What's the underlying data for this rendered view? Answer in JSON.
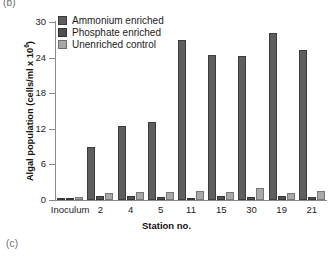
{
  "panel_labels": {
    "top": "(b)",
    "bottom": "(c)"
  },
  "chart_data": {
    "type": "bar",
    "title": "",
    "xlabel": "Station no.",
    "ylabel": "Algal population (cells/ml x 10",
    "ylabel_exponent": "6",
    "ylabel_close": ")",
    "categories": [
      "Inoculum",
      "2",
      "4",
      "5",
      "11",
      "15",
      "30",
      "19",
      "21"
    ],
    "ylim": [
      0,
      30
    ],
    "yticks": [
      0,
      6,
      12,
      18,
      24,
      30
    ],
    "ytick_labels": [
      "0",
      "6",
      "12",
      "18",
      "24",
      "30"
    ],
    "grid": false,
    "legend_position": "top-left",
    "series": [
      {
        "name": "Ammonium enriched",
        "color": "#5e5e5e",
        "values": [
          0.4,
          9.0,
          12.4,
          13.1,
          27.0,
          24.5,
          24.3,
          28.2,
          25.3
        ]
      },
      {
        "name": "Phosphate enriched",
        "color": "#4f4f4f",
        "values": [
          0.3,
          0.6,
          0.7,
          0.5,
          0.3,
          0.6,
          0.5,
          0.6,
          0.5
        ]
      },
      {
        "name": "Unenriched control",
        "color": "#a8a8a8",
        "values": [
          0.5,
          1.2,
          1.3,
          1.3,
          1.5,
          1.3,
          2.1,
          1.2,
          1.5
        ]
      }
    ]
  }
}
